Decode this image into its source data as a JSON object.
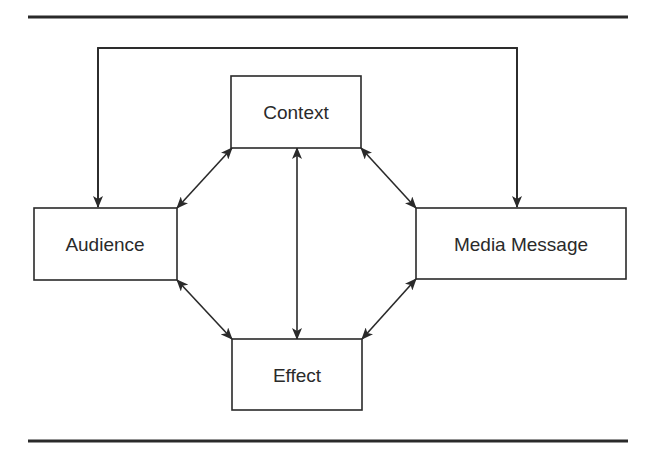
{
  "diagram": {
    "nodes": {
      "context": {
        "label": "Context"
      },
      "audience": {
        "label": "Audience"
      },
      "media_message": {
        "label": "Media Message"
      },
      "effect": {
        "label": "Effect"
      }
    },
    "edges": [
      {
        "from": "audience",
        "to": "context",
        "type": "bidirectional"
      },
      {
        "from": "context",
        "to": "media_message",
        "type": "bidirectional"
      },
      {
        "from": "audience",
        "to": "effect",
        "type": "bidirectional"
      },
      {
        "from": "effect",
        "to": "media_message",
        "type": "bidirectional"
      },
      {
        "from": "context",
        "to": "effect",
        "type": "bidirectional"
      },
      {
        "from": "top-loop",
        "to": "audience",
        "type": "directed"
      },
      {
        "from": "top-loop",
        "to": "media_message",
        "type": "directed"
      }
    ],
    "colors": {
      "line": "#2a2a2a",
      "background": "#ffffff"
    }
  }
}
